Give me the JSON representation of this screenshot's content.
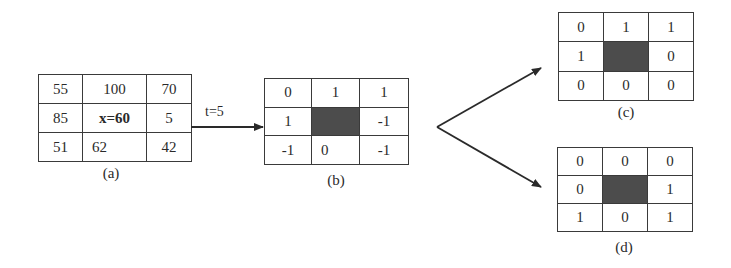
{
  "diagram": {
    "panels": [
      {
        "id": "a",
        "caption": "(a)",
        "cells": [
          [
            "55",
            "100",
            "70"
          ],
          [
            "85",
            "x=60",
            "5"
          ],
          [
            "51",
            "62",
            "42"
          ]
        ],
        "center_shaded": false
      },
      {
        "id": "b",
        "caption": "(b)",
        "cells": [
          [
            "0",
            "1",
            "1"
          ],
          [
            "1",
            "",
            "-1"
          ],
          [
            "-1",
            "0",
            "-1"
          ]
        ],
        "center_shaded": true
      },
      {
        "id": "c",
        "caption": "(c)",
        "cells": [
          [
            "0",
            "1",
            "1"
          ],
          [
            "1",
            "",
            "0"
          ],
          [
            "0",
            "0",
            "0"
          ]
        ],
        "center_shaded": true
      },
      {
        "id": "d",
        "caption": "(d)",
        "cells": [
          [
            "0",
            "0",
            "0"
          ],
          [
            "0",
            "",
            "1"
          ],
          [
            "1",
            "0",
            "1"
          ]
        ],
        "center_shaded": true
      }
    ],
    "arrows": [
      {
        "from": "a",
        "to": "b",
        "label": "t=5"
      },
      {
        "from": "b",
        "to": "c",
        "label": ""
      },
      {
        "from": "b",
        "to": "d",
        "label": ""
      }
    ],
    "colors": {
      "line": "#3a3a3a",
      "shaded_cell": "#6b6b6b",
      "text": "#2a2a2a",
      "background": "#ffffff"
    }
  }
}
